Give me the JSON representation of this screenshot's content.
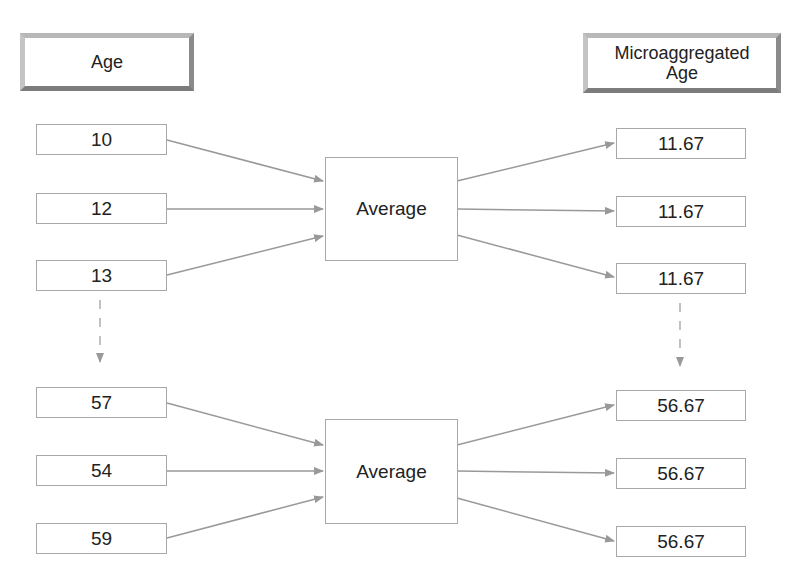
{
  "headers": {
    "left": "Age",
    "right_line1": "Microaggregated",
    "right_line2": "Age"
  },
  "groups": [
    {
      "inputs": [
        "10",
        "12",
        "13"
      ],
      "operation": "Average",
      "outputs": [
        "11.67",
        "11.67",
        "11.67"
      ]
    },
    {
      "inputs": [
        "57",
        "54",
        "59"
      ],
      "operation": "Average",
      "outputs": [
        "56.67",
        "56.67",
        "56.67"
      ]
    }
  ],
  "colors": {
    "arrow": "#999999",
    "box_border": "#a8a8a8"
  }
}
